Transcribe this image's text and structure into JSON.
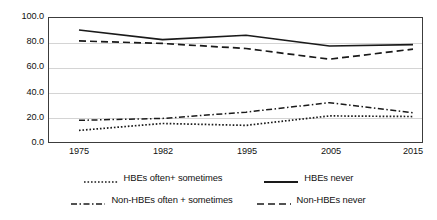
{
  "chart_data": {
    "type": "line",
    "title": "",
    "xlabel": "",
    "ylabel": "",
    "categories": [
      "1975",
      "1982",
      "1995",
      "2005",
      "2015"
    ],
    "ylim": [
      0,
      100
    ],
    "yticks": [
      "0.0",
      "20.0",
      "40.0",
      "60.0",
      "80.0",
      "100.0"
    ],
    "ytick_values": [
      0,
      20,
      40,
      60,
      80,
      100
    ],
    "grid": true,
    "legend_position": "bottom",
    "series": [
      {
        "name": "HBEs often+ sometimes",
        "style": "dotted",
        "color": "#1a1a1a",
        "values": [
          10.0,
          15.5,
          14.0,
          21.5,
          21.0
        ]
      },
      {
        "name": "HBEs never",
        "style": "solid",
        "color": "#1a1a1a",
        "values": [
          89.7,
          82.0,
          85.5,
          77.0,
          78.0
        ]
      },
      {
        "name": "Non-HBEs often + sometimes",
        "style": "dashdot",
        "color": "#1a1a1a",
        "values": [
          18.0,
          19.5,
          24.5,
          32.0,
          24.0
        ]
      },
      {
        "name": "Non-HBEs never",
        "style": "dashed",
        "color": "#1a1a1a",
        "values": [
          81.0,
          79.0,
          75.0,
          66.5,
          74.5
        ]
      }
    ]
  },
  "axis": {
    "y_labels": [
      "100.0",
      "80.0",
      "60.0",
      "40.0",
      "20.0",
      "0.0"
    ],
    "x_labels": [
      "1975",
      "1982",
      "1995",
      "2005",
      "2015"
    ]
  },
  "legend": {
    "row1": [
      {
        "label": "HBEs often+ sometimes",
        "style": "dotted"
      },
      {
        "label": "HBEs never",
        "style": "solid"
      }
    ],
    "row2": [
      {
        "label": "Non-HBEs often + sometimes",
        "style": "dashdot"
      },
      {
        "label": "Non-HBEs never",
        "style": "dashed"
      }
    ]
  },
  "colors": {
    "line": "#1a1a1a",
    "grid": "#d4d4d4",
    "frame": "#3c3c3c",
    "text": "#111111",
    "background": "#ffffff"
  }
}
